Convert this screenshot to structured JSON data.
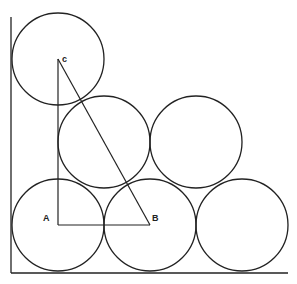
{
  "diagram": {
    "stroke_color": "#222222",
    "background": "#ffffff",
    "wall": {
      "x": 11,
      "y1": 17,
      "y2": 273
    },
    "floor": {
      "y": 273,
      "x1": 11,
      "x2": 288
    },
    "radius": 46,
    "circles": [
      {
        "name": "circle-c",
        "cx": 58,
        "cy": 59
      },
      {
        "name": "circle-middle-left",
        "cx": 104,
        "cy": 142
      },
      {
        "name": "circle-middle-right",
        "cx": 196,
        "cy": 142
      },
      {
        "name": "circle-a",
        "cx": 58,
        "cy": 225
      },
      {
        "name": "circle-b",
        "cx": 150,
        "cy": 225
      },
      {
        "name": "circle-bottom-right",
        "cx": 242,
        "cy": 225
      }
    ],
    "triangle": {
      "A": {
        "x": 58,
        "y": 225
      },
      "B": {
        "x": 150,
        "y": 225
      },
      "C": {
        "x": 58,
        "y": 59
      }
    },
    "labels": {
      "A": {
        "text": "A",
        "x": 43,
        "y": 221
      },
      "B": {
        "text": "B",
        "x": 152,
        "y": 221
      },
      "C": {
        "text": "c",
        "x": 62,
        "y": 62
      }
    }
  }
}
